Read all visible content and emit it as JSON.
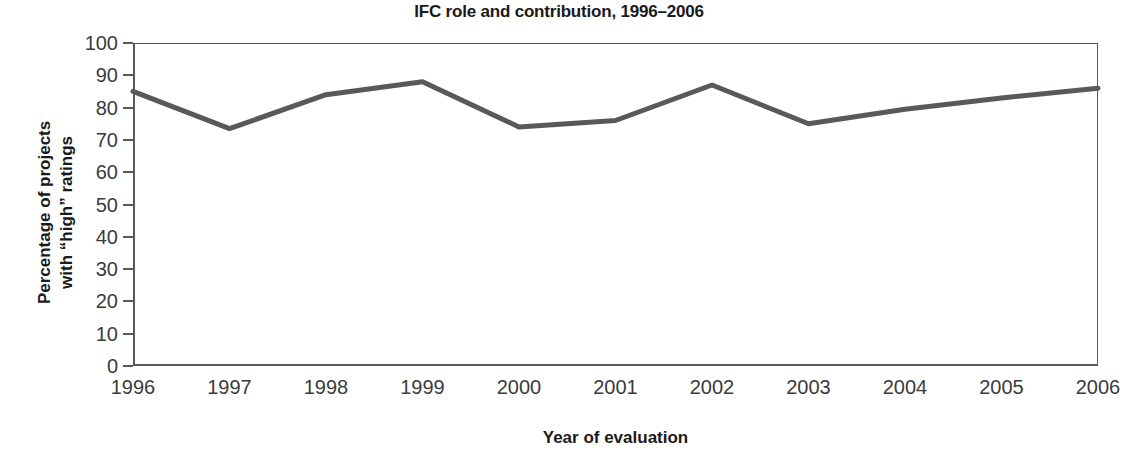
{
  "chart_data": {
    "type": "line",
    "title": "IFC role and contribution, 1996–2006",
    "xlabel": "Year of evaluation",
    "ylabel_line1": "Percentage of projects",
    "ylabel_line2": "with “high” ratings",
    "categories": [
      "1996",
      "1997",
      "1998",
      "1999",
      "2000",
      "2001",
      "2002",
      "2003",
      "2004",
      "2005",
      "2006"
    ],
    "values": [
      85,
      73.5,
      84,
      88,
      74,
      76,
      87,
      75,
      79.5,
      83,
      86
    ],
    "series": [
      {
        "name": "IFC role and contribution",
        "values": [
          85,
          73.5,
          84,
          88,
          74,
          76,
          87,
          75,
          79.5,
          83,
          86
        ],
        "color": "#58595b"
      }
    ],
    "ylim": [
      0,
      100
    ],
    "ytick_values": [
      100,
      90,
      80,
      70,
      60,
      50,
      40,
      30,
      20,
      10,
      0
    ],
    "ytick_labels": [
      "100",
      "90",
      "80",
      "70",
      "60",
      "50",
      "40",
      "30",
      "20",
      "10",
      "0"
    ],
    "xlim": [
      "1996",
      "2006"
    ],
    "grid": false,
    "legend": false,
    "line_color": "#58595b",
    "line_width": 5,
    "axis_color": "#58595b",
    "background": "#ffffff"
  }
}
